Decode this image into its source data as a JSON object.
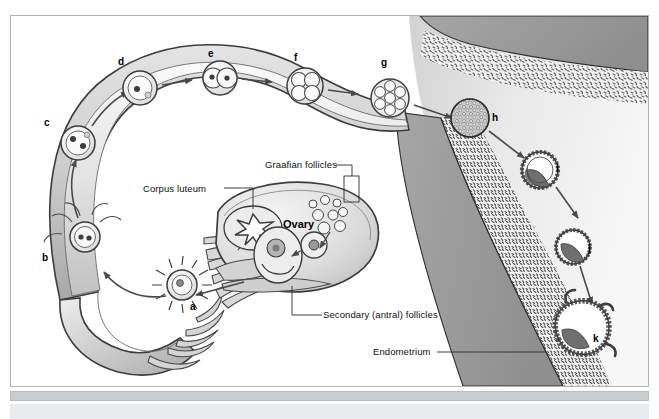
{
  "figure": {
    "stage_letters": [
      {
        "id": "a",
        "label": "a",
        "x": 190,
        "y": 301,
        "meaning": "ovum-with-sperm"
      },
      {
        "id": "b",
        "label": "b",
        "x": 42,
        "y": 252,
        "meaning": "fertilized-ovum"
      },
      {
        "id": "c",
        "label": "c",
        "x": 44,
        "y": 117,
        "meaning": "zygote-pronuclei"
      },
      {
        "id": "d",
        "label": "d",
        "x": 118,
        "y": 56,
        "meaning": "zygote"
      },
      {
        "id": "e",
        "label": "e",
        "x": 208,
        "y": 48,
        "meaning": "two-cell-stage"
      },
      {
        "id": "f",
        "label": "f",
        "x": 294,
        "y": 52,
        "meaning": "four-cell-stage"
      },
      {
        "id": "g",
        "label": "g",
        "x": 381,
        "y": 57,
        "meaning": "morula"
      },
      {
        "id": "h",
        "label": "h",
        "x": 492,
        "y": 112,
        "meaning": "late-morula"
      },
      {
        "id": "i",
        "label": "i",
        "x": 556,
        "y": 163,
        "meaning": "early-blastocyst"
      },
      {
        "id": "j",
        "label": "j",
        "x": 588,
        "y": 243,
        "meaning": "blastocyst"
      },
      {
        "id": "k",
        "label": "k",
        "x": 593,
        "y": 333,
        "meaning": "implanting-blastocyst"
      }
    ],
    "callouts": [
      {
        "id": "corpus-luteum",
        "text": "Corpus luteum",
        "x": 160,
        "y": 190
      },
      {
        "id": "graafian-follicles",
        "text": "Graafian follicles",
        "x": 265,
        "y": 164
      },
      {
        "id": "secondary-antral-follicles",
        "text": "Secondary (antral) follicles",
        "x": 323,
        "y": 311
      },
      {
        "id": "endometrium",
        "text": "Endometrium",
        "x": 377,
        "y": 349
      }
    ],
    "organ_labels": [
      {
        "id": "ovary",
        "text": "Ovary",
        "x": 283,
        "y": 224
      }
    ],
    "colors": {
      "background": "#ffffff",
      "frame_border": "#b4b4b4",
      "bottom_bar": "#c8cdcf",
      "tube_wall_outline": "#5a5a5a",
      "tube_fill_light": "#f2f2f2",
      "tube_fill_mid": "#c9c9c9",
      "tube_fill_dark": "#a8a8a8",
      "myometrium": "#9a9a9a",
      "endometrium_stipple": "#6b6b6b",
      "uterine_cavity": "#ededed",
      "ovary_fill": "#e6e6e6",
      "embryo_outline": "#3b3b3b",
      "text": "#111111"
    }
  }
}
